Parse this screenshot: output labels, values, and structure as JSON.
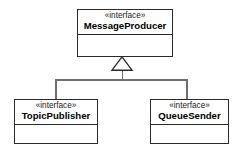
{
  "diagram": {
    "type": "uml-class-diagram",
    "relationship": "generalization",
    "background_color": "#ffffff",
    "border_color": "#2b2b2b",
    "connector_color": "#6f6f6f",
    "nodes": [
      {
        "id": "messageproducer",
        "stereotype": "«interface»",
        "name": "MessageProducer",
        "role": "parent"
      },
      {
        "id": "topicpublisher",
        "stereotype": "«interface»",
        "name": "TopicPublisher",
        "role": "child"
      },
      {
        "id": "queuesender",
        "stereotype": "«interface»",
        "name": "QueueSender",
        "role": "child"
      }
    ],
    "edges": [
      {
        "from": "topicpublisher",
        "to": "messageproducer",
        "kind": "generalization",
        "arrow": "hollow-triangle"
      },
      {
        "from": "queuesender",
        "to": "messageproducer",
        "kind": "generalization",
        "arrow": "hollow-triangle"
      }
    ]
  }
}
